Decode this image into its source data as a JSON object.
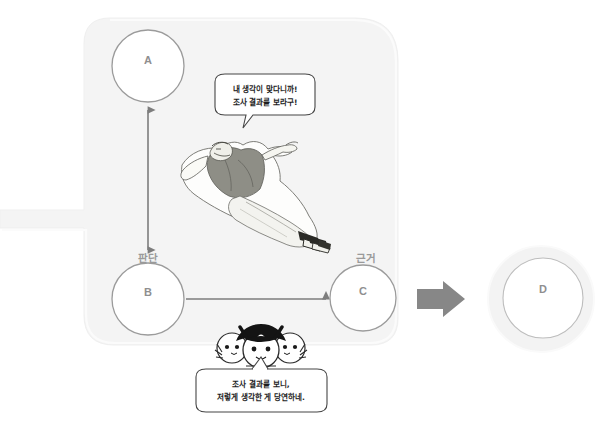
{
  "diagram": {
    "background_color": "#ffffff",
    "panel_color": "#f4f4f4",
    "node_stroke_color": "#9b9b9b",
    "label_color": "#9a9a9a",
    "arrow_color": "#7d7d7d",
    "block_arrow_color": "#878787",
    "nodes": [
      {
        "id": "A",
        "label": "A",
        "cx": 148,
        "cy": 66,
        "r": 36
      },
      {
        "id": "B",
        "label": "B",
        "cx": 148,
        "cy": 299,
        "r": 36
      },
      {
        "id": "C",
        "label": "C",
        "cx": 363,
        "cy": 298,
        "r": 33
      },
      {
        "id": "D",
        "label": "D",
        "cx": 543,
        "cy": 298,
        "r": 40
      }
    ],
    "edges": [
      {
        "from": "B",
        "to": "A",
        "label": "판단",
        "type": "double-arrow",
        "orientation": "vertical"
      },
      {
        "from": "B",
        "to": "C",
        "label": "근거",
        "type": "arrow",
        "orientation": "horizontal"
      },
      {
        "from": "C",
        "to": "D",
        "label": "",
        "type": "block-arrow",
        "orientation": "horizontal"
      }
    ],
    "edge_labels": [
      {
        "text": "판단",
        "x": 148,
        "y": 258
      },
      {
        "text": "근거",
        "x": 366,
        "y": 258
      }
    ],
    "speech_bubbles": [
      {
        "id": "philosopher-bubble",
        "speaker": "reclining-philosopher",
        "lines": [
          "내 생각이 맞다니까!",
          "조사 결과를 보라구!"
        ],
        "x": 264,
        "y": 99
      },
      {
        "id": "students-bubble",
        "speaker": "students-group",
        "lines": [
          "조사 결과를 보니,",
          "저렇게 생각한 게 당연하네."
        ],
        "x": 261,
        "y": 393
      }
    ],
    "illustrations": [
      {
        "name": "reclining-philosopher-illustration",
        "description": "robed figure reclining, pointing"
      },
      {
        "name": "students-group-illustration",
        "description": "three round characters, middle one wearing a black cap"
      }
    ]
  }
}
